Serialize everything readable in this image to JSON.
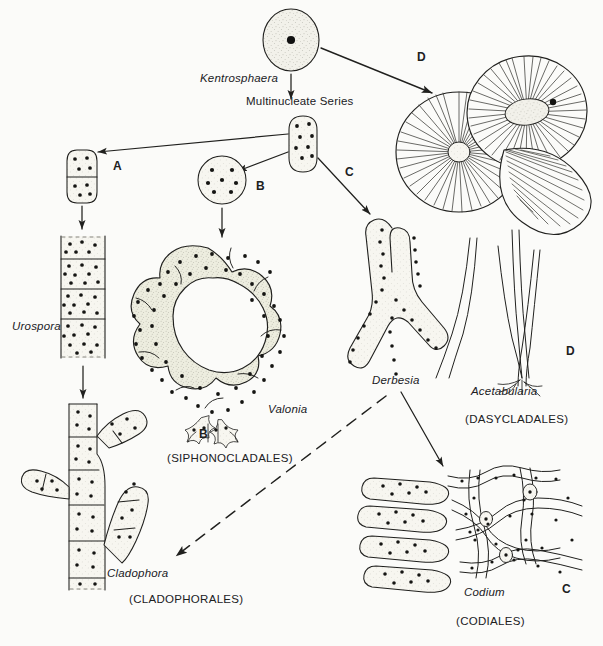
{
  "figure": {
    "type": "diagram",
    "background_color": "#fbfbf9",
    "ink_color": "#20201e",
    "stipple_fill": "#f0efe9"
  },
  "nodes": {
    "kentrosphaera": {
      "genus": "Kentrosphaera",
      "shape": "uninucleate-sphere",
      "nuclei": 1
    },
    "multinucleate_series": {
      "label": "Multinucleate Series"
    },
    "hub_cell": {
      "shape": "multinucleate-ovoid",
      "nuclei": 8
    },
    "branch_a_cell": {
      "shape": "two-celled-filament",
      "nuclei": 8
    },
    "branch_b_cell": {
      "shape": "multinucleate-sphere",
      "nuclei": 7
    }
  },
  "taxa": [
    {
      "id": "urospora",
      "genus": "Urospora",
      "order": "",
      "branch": "A",
      "description": "unbranched multinucleate filament with transverse cross walls"
    },
    {
      "id": "cladophora",
      "genus": "Cladophora",
      "order": "(CLADOPHORALES)",
      "branch": "A",
      "description": "branched septate multinucleate filament"
    },
    {
      "id": "valonia",
      "genus": "Valonia",
      "order": "(SIPHONOCLADALES)",
      "branch": "B",
      "description": "large coenocytic vesicle with segregative division and rhizoidal holdfast"
    },
    {
      "id": "derbesia",
      "genus": "Derbesia",
      "order": "",
      "branch": "C",
      "description": "siphonous branched coenocytic thallus"
    },
    {
      "id": "codium",
      "genus": "Codium",
      "order": "(CODIALES)",
      "branch": "C",
      "description": "interwoven siphons forming medulla with club-shaped utricles"
    },
    {
      "id": "acetabularia",
      "genus": "Acetabularia",
      "order": "(DASYCLADALES)",
      "branch": "D",
      "description": "stalked umbrella-shaped cap of radiating gametangial rays"
    }
  ],
  "branch_labels": [
    {
      "key": "A",
      "text": "A",
      "position": "left of hub"
    },
    {
      "key": "B",
      "text": "B",
      "position": "below spherical cell"
    },
    {
      "key": "B2",
      "text": "B",
      "position": "beside Valonia holdfast"
    },
    {
      "key": "C",
      "text": "C",
      "position": "right of hub"
    },
    {
      "key": "C2",
      "text": "C",
      "position": "right of Codium"
    },
    {
      "key": "D",
      "text": "D",
      "position": "upper right arrow"
    },
    {
      "key": "D2",
      "text": "D",
      "position": "beside Acetabularia stalks"
    }
  ],
  "arrows": [
    {
      "from": "kentrosphaera",
      "to": "multinucleate_series",
      "style": "solid"
    },
    {
      "from": "kentrosphaera",
      "to": "acetabularia",
      "style": "solid",
      "label": "D"
    },
    {
      "from": "hub_cell",
      "to": "branch_a_cell",
      "style": "solid",
      "label": "A"
    },
    {
      "from": "hub_cell",
      "to": "branch_b_cell",
      "style": "solid",
      "label": "B"
    },
    {
      "from": "hub_cell",
      "to": "derbesia",
      "style": "solid",
      "label": "C"
    },
    {
      "from": "branch_a_cell",
      "to": "urospora",
      "style": "solid"
    },
    {
      "from": "urospora",
      "to": "cladophora",
      "style": "solid"
    },
    {
      "from": "branch_b_cell",
      "to": "valonia",
      "style": "solid"
    },
    {
      "from": "derbesia",
      "to": "codium",
      "style": "solid"
    },
    {
      "from": "derbesia",
      "to": "cladophora",
      "style": "dashed"
    }
  ]
}
